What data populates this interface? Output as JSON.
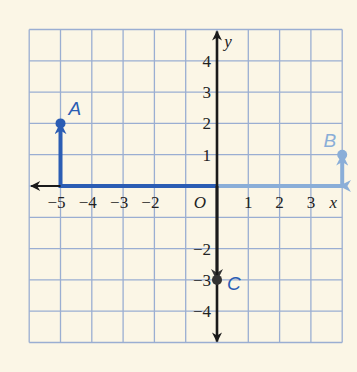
{
  "chart_data": {
    "type": "scatter",
    "title": "",
    "xlabel": "x",
    "ylabel": "y",
    "origin_label": "O",
    "xlim": [
      -6,
      4
    ],
    "ylim": [
      -5,
      5
    ],
    "grid": true,
    "x_ticks": [
      {
        "value": -5,
        "label": "−5"
      },
      {
        "value": -4,
        "label": "−4"
      },
      {
        "value": -3,
        "label": "−3"
      },
      {
        "value": -2,
        "label": "−2"
      },
      {
        "value": 1,
        "label": "1"
      },
      {
        "value": 2,
        "label": "2"
      },
      {
        "value": 3,
        "label": "3"
      }
    ],
    "y_ticks": [
      {
        "value": 4,
        "label": "4"
      },
      {
        "value": 3,
        "label": "3"
      },
      {
        "value": 2,
        "label": "2"
      },
      {
        "value": 1,
        "label": "1"
      },
      {
        "value": -2,
        "label": "−2"
      },
      {
        "value": -3,
        "label": "−3"
      },
      {
        "value": -4,
        "label": "−4"
      }
    ],
    "points": [
      {
        "name": "A",
        "x": -5,
        "y": 2,
        "color": "#2b5db4"
      },
      {
        "name": "B",
        "x": 4,
        "y": 1,
        "color": "#8aaed8"
      },
      {
        "name": "C",
        "x": 0,
        "y": -3,
        "color": "#333333"
      }
    ],
    "paths": [
      {
        "to": "A",
        "description": "from origin left 5 units then up 2 units",
        "segments": [
          [
            0,
            0
          ],
          [
            -5,
            0
          ],
          [
            -5,
            2
          ]
        ],
        "color": "#2b5db4"
      },
      {
        "to": "B",
        "description": "from origin right 4 units then up 1 unit",
        "segments": [
          [
            0,
            0
          ],
          [
            4,
            0
          ],
          [
            4,
            1
          ]
        ],
        "color": "#8aaed8"
      },
      {
        "to": "C",
        "description": "from origin down 3 units",
        "segments": [
          [
            0,
            0
          ],
          [
            0,
            -3
          ]
        ],
        "color": "#333333"
      }
    ]
  },
  "colors": {
    "background": "#fbf6e6",
    "grid": "#9aaed2",
    "axis": "#1a1a1a",
    "path_a": "#2b5db4",
    "path_b": "#8aaed8",
    "path_c": "#333333",
    "label_c": "#2b5db4"
  }
}
